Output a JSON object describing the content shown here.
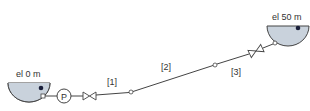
{
  "diagram": {
    "type": "pipeline-system",
    "colors": {
      "line": "#444444",
      "water": "#c9d2dc",
      "background": "#ffffff",
      "dot": "#1a1f3a"
    },
    "reservoirs": [
      {
        "id": "lower",
        "label": "el 0 m"
      },
      {
        "id": "upper",
        "label": "el 50 m"
      }
    ],
    "pump": {
      "label": "P"
    },
    "pipes": [
      {
        "label": "[1]"
      },
      {
        "label": "[2]"
      },
      {
        "label": "[3]"
      }
    ]
  }
}
